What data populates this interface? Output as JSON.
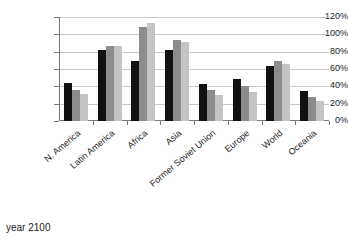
{
  "caption": "year 2100",
  "chart_data": {
    "type": "bar",
    "title": "",
    "subtitle": "",
    "xlabel": "",
    "ylabel": "",
    "ylim": [
      0,
      120
    ],
    "ytick_labels": [
      "0%",
      "20%",
      "40%",
      "60%",
      "80%",
      "100%",
      "120%"
    ],
    "ytick_values": [
      0,
      20,
      40,
      60,
      80,
      100,
      120
    ],
    "grid": true,
    "legend": false,
    "legend_position": "none",
    "categories": [
      "N. America",
      "Latin America",
      "Africa",
      "Asia",
      "Former Soviet Union",
      "Europe",
      "World",
      "Oceania"
    ],
    "series": [
      {
        "name": "series-1",
        "color": "#111111",
        "values": [
          44,
          82,
          69,
          82,
          43,
          49,
          63,
          35
        ]
      },
      {
        "name": "series-2",
        "color": "#8c8c8c",
        "values": [
          36,
          87,
          109,
          93,
          36,
          40,
          69,
          28
        ]
      },
      {
        "name": "series-3",
        "color": "#c4c4c4",
        "values": [
          31,
          87,
          113,
          91,
          30,
          33,
          66,
          23
        ]
      }
    ]
  }
}
